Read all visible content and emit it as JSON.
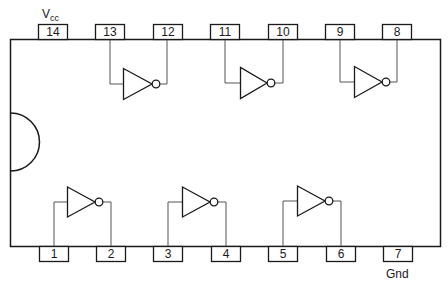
{
  "diagram": {
    "type": "ic-pinout",
    "power_label": "V",
    "power_label_sub": "cc",
    "ground_label": "Gnd",
    "colors": {
      "line": "#1a1a1a",
      "wire": "#555555",
      "background": "#ffffff"
    },
    "top_pins": [
      {
        "number": "14",
        "role": "Vcc"
      },
      {
        "number": "13",
        "role": "input"
      },
      {
        "number": "12",
        "role": "output"
      },
      {
        "number": "11",
        "role": "input"
      },
      {
        "number": "10",
        "role": "output"
      },
      {
        "number": "9",
        "role": "input"
      },
      {
        "number": "8",
        "role": "output"
      }
    ],
    "bottom_pins": [
      {
        "number": "1",
        "role": "input"
      },
      {
        "number": "2",
        "role": "output"
      },
      {
        "number": "3",
        "role": "input"
      },
      {
        "number": "4",
        "role": "output"
      },
      {
        "number": "5",
        "role": "input"
      },
      {
        "number": "6",
        "role": "output"
      },
      {
        "number": "7",
        "role": "Gnd"
      }
    ],
    "gates": [
      {
        "type": "inverter",
        "input_pin": "13",
        "output_pin": "12"
      },
      {
        "type": "inverter",
        "input_pin": "11",
        "output_pin": "10"
      },
      {
        "type": "inverter",
        "input_pin": "9",
        "output_pin": "8"
      },
      {
        "type": "inverter",
        "input_pin": "1",
        "output_pin": "2"
      },
      {
        "type": "inverter",
        "input_pin": "3",
        "output_pin": "4"
      },
      {
        "type": "inverter",
        "input_pin": "5",
        "output_pin": "6"
      }
    ]
  }
}
